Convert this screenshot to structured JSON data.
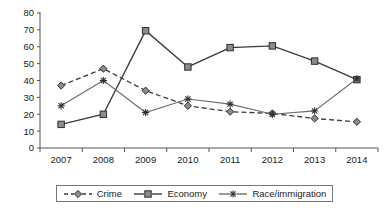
{
  "chart_data": {
    "type": "line",
    "title": "",
    "subtitle": "",
    "xlabel": "",
    "ylabel": "",
    "categories": [
      "2007",
      "2008",
      "2009",
      "2010",
      "2011",
      "2012",
      "2013",
      "2014"
    ],
    "x_tick_labels": [
      "2007",
      "2008",
      "2009",
      "2010",
      "2011",
      "2012",
      "2013",
      "2014"
    ],
    "y_tick_labels": [
      "0",
      "10",
      "20",
      "30",
      "40",
      "50",
      "60",
      "70",
      "80"
    ],
    "y_ticks": [
      0,
      10,
      20,
      30,
      40,
      50,
      60,
      70,
      80
    ],
    "ylim": [
      0,
      80
    ],
    "grid": false,
    "legend_position": "bottom",
    "series": [
      {
        "name": "Crime",
        "marker": "diamond",
        "line_style": "dashed",
        "color": "#3b3b3b",
        "values": [
          37,
          47,
          34,
          25,
          21.5,
          20.5,
          17.5,
          15.5
        ]
      },
      {
        "name": "Economy",
        "marker": "square",
        "line_style": "solid",
        "color": "#3b3b3b",
        "values": [
          14,
          20,
          69.5,
          48,
          59.5,
          60.5,
          51.5,
          40.5
        ]
      },
      {
        "name": "Race/immigration",
        "marker": "star",
        "line_style": "solid",
        "color": "#6e6e6e",
        "values": [
          25,
          40,
          21,
          29,
          26,
          20,
          22,
          41
        ]
      }
    ]
  },
  "legend": {
    "items": [
      {
        "label": "Crime",
        "marker": "diamond-marker",
        "style": "dashed"
      },
      {
        "label": "Economy",
        "marker": "square-marker",
        "style": "solid"
      },
      {
        "label": "Race/immigration",
        "marker": "star-marker",
        "style": "solid"
      }
    ]
  }
}
